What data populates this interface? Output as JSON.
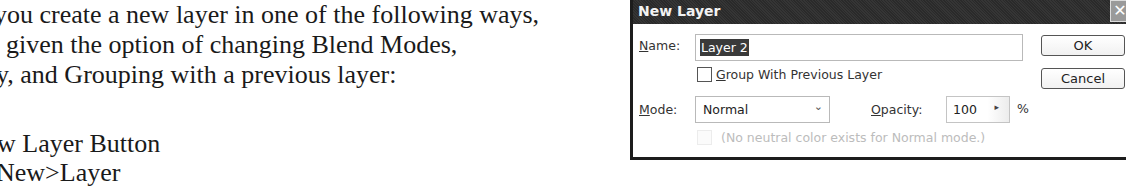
{
  "document": {
    "lines": [
      "you create a new layer in one of the following ways,",
      "given the option of changing Blend Modes,",
      "y, and Grouping with a previous layer:",
      "w Layer Button",
      "New>Layer"
    ]
  },
  "dialog": {
    "title": "New Layer",
    "close_icon": "✕",
    "name_label": "Name:",
    "name_label_mnemonic": "N",
    "name_label_rest": "ame:",
    "name_value": "Layer 2",
    "group_checkbox_checked": false,
    "group_label_mnemonic": "G",
    "group_label_rest": "roup With Previous Layer",
    "mode_label_mnemonic": "M",
    "mode_label_rest": "ode:",
    "mode_value": "Normal",
    "mode_chevron": "▾",
    "opacity_label_mnemonic": "O",
    "opacity_label_rest": "pacity:",
    "opacity_value": "100",
    "opacity_arrow": "▸",
    "percent": "%",
    "neutral_hint": "(No neutral color exists for Normal mode.)",
    "ok_label": "OK",
    "cancel_label": "Cancel"
  }
}
